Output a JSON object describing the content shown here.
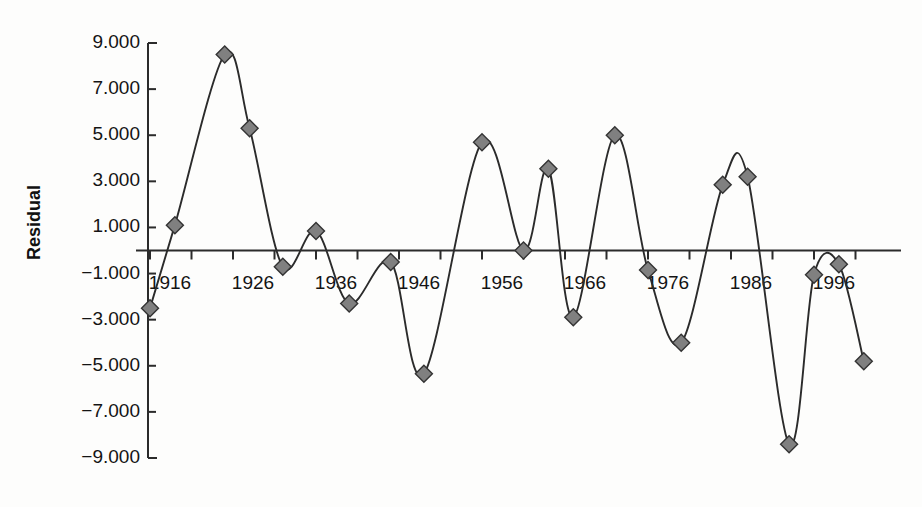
{
  "chart_data": {
    "type": "line",
    "title": "",
    "subtitle": "",
    "xlabel": "",
    "ylabel": "Residual",
    "xlim": [
      1913,
      2004
    ],
    "ylim": [
      -9.0,
      9.0
    ],
    "grid": false,
    "legend": null,
    "marker": "diamond",
    "marker_fill": "#808080",
    "marker_edge": "#333333",
    "line_color": "#2b2b2b",
    "zero_line": 0,
    "x_tick_labels": [
      "1916",
      "1926",
      "1936",
      "1946",
      "1956",
      "1966",
      "1976",
      "1986",
      "1996"
    ],
    "x_tick_values": [
      1916,
      1926,
      1936,
      1946,
      1956,
      1966,
      1976,
      1986,
      1996
    ],
    "x_minor_step": 5,
    "y_tick_labels": [
      "9.000",
      "7.000",
      "5.000",
      "3.000",
      "1.000",
      "−1.000",
      "−3.000",
      "−5.000",
      "−7.000",
      "−9.000"
    ],
    "y_tick_values": [
      9,
      7,
      5,
      3,
      1,
      -1,
      -3,
      -5,
      -7,
      -9
    ],
    "x": [
      1916,
      1921,
      1926,
      1931,
      1936,
      1941,
      1946,
      1951,
      1956,
      1961,
      1966,
      1971,
      1976,
      1981,
      1986,
      1991,
      1996,
      2001
    ],
    "values": [
      -2.5,
      1.1,
      8.5,
      5.3,
      -0.7,
      0.85,
      -2.3,
      -0.5,
      -5.35,
      4.7,
      0.0,
      3.55,
      -2.9,
      5.0,
      -0.85,
      -4.0,
      2.85,
      3.2
    ],
    "series": [
      {
        "name": "Residual",
        "points": [
          {
            "x": 1916,
            "y": -2.5
          },
          {
            "x": 1919,
            "y": 1.1
          },
          {
            "x": 1925,
            "y": 8.5
          },
          {
            "x": 1928,
            "y": 5.3
          },
          {
            "x": 1932,
            "y": -0.7
          },
          {
            "x": 1936,
            "y": 0.85
          },
          {
            "x": 1940,
            "y": -2.3
          },
          {
            "x": 1945,
            "y": -0.5
          },
          {
            "x": 1949,
            "y": -5.35
          },
          {
            "x": 1956,
            "y": 4.7
          },
          {
            "x": 1961,
            "y": 0.0
          },
          {
            "x": 1964,
            "y": 3.55
          },
          {
            "x": 1967,
            "y": -2.9
          },
          {
            "x": 1972,
            "y": 5.0
          },
          {
            "x": 1976,
            "y": -0.85
          },
          {
            "x": 1980,
            "y": -4.0
          },
          {
            "x": 1985,
            "y": 2.85
          },
          {
            "x": 1988,
            "y": 3.2
          },
          {
            "x": 1993,
            "y": -8.4
          },
          {
            "x": 1996,
            "y": -1.05
          },
          {
            "x": 1999,
            "y": -0.6
          },
          {
            "x": 2002,
            "y": -4.8
          }
        ]
      }
    ]
  }
}
